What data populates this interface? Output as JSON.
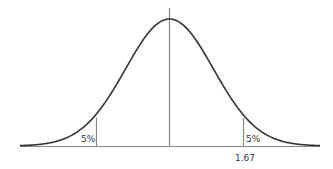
{
  "diagram": {
    "type": "normal-distribution",
    "left_tail": {
      "label": "5%"
    },
    "right_tail": {
      "label": "5%"
    },
    "critical_value_label": "1.67",
    "colors": {
      "curve": "#333333",
      "axis": "#888888",
      "lines": "#888888"
    }
  },
  "chart_data": {
    "type": "line",
    "title": "",
    "xlabel": "",
    "ylabel": "",
    "annotations": [
      {
        "text": "5%",
        "position": "left tail area"
      },
      {
        "text": "5%",
        "position": "right tail area"
      },
      {
        "text": "1.67",
        "position": "x-axis below right cutoff"
      }
    ],
    "x_ticks": [
      "1.67"
    ],
    "cutoffs": [
      -1.67,
      1.67
    ],
    "tail_area_each": 0.05,
    "center": 0,
    "grid": false,
    "legend": null
  }
}
